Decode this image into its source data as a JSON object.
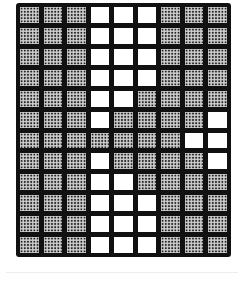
{
  "figure": {
    "type": "grid-pattern",
    "rows": 12,
    "cols": 9,
    "legend": {
      "1": "shaded (dotted halftone)",
      "0": "white"
    },
    "colors": {
      "border": "#111111",
      "shaded": "#cfcfcf",
      "dots": "#222222",
      "white": "#ffffff"
    },
    "cells": [
      [
        1,
        1,
        1,
        0,
        0,
        0,
        1,
        1,
        1
      ],
      [
        1,
        1,
        1,
        0,
        0,
        0,
        1,
        1,
        1
      ],
      [
        1,
        1,
        1,
        0,
        0,
        0,
        1,
        1,
        1
      ],
      [
        1,
        1,
        1,
        0,
        0,
        0,
        1,
        1,
        1
      ],
      [
        1,
        1,
        1,
        0,
        0,
        1,
        1,
        1,
        1
      ],
      [
        1,
        1,
        1,
        0,
        1,
        1,
        1,
        1,
        0
      ],
      [
        1,
        1,
        1,
        1,
        1,
        1,
        1,
        0,
        0
      ],
      [
        1,
        1,
        1,
        0,
        1,
        1,
        1,
        1,
        0
      ],
      [
        1,
        1,
        1,
        0,
        0,
        1,
        1,
        1,
        1
      ],
      [
        1,
        1,
        1,
        0,
        0,
        0,
        1,
        1,
        1
      ],
      [
        1,
        1,
        1,
        0,
        0,
        0,
        1,
        1,
        1
      ],
      [
        1,
        1,
        1,
        0,
        0,
        0,
        1,
        1,
        1
      ]
    ]
  }
}
